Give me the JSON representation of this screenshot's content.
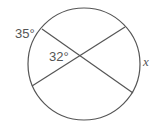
{
  "diagram": {
    "type": "circle-intersecting-chords",
    "labels": {
      "arc_upper_left": "35°",
      "angle_at_intersection": "32°",
      "arc_right": "x"
    },
    "colors": {
      "stroke": "#555555",
      "background": "#ffffff"
    }
  }
}
